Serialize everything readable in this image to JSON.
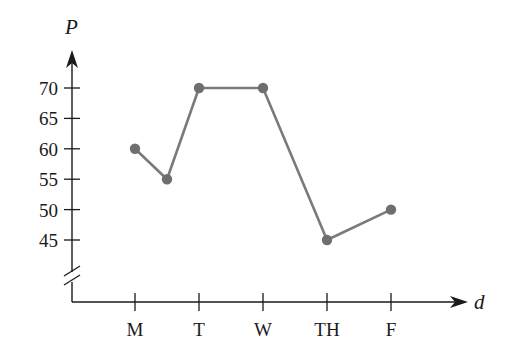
{
  "chart_data": {
    "type": "line",
    "title": "",
    "xlabel": "d",
    "ylabel": "P",
    "categories": [
      "M",
      "T",
      "W",
      "TH",
      "F"
    ],
    "x_positions": [
      1,
      2,
      3,
      4,
      5
    ],
    "points": [
      {
        "x": 1,
        "y": 60
      },
      {
        "x": 1.5,
        "y": 55
      },
      {
        "x": 2,
        "y": 70
      },
      {
        "x": 3,
        "y": 70
      },
      {
        "x": 4,
        "y": 45
      },
      {
        "x": 5,
        "y": 50
      }
    ],
    "series": [
      {
        "name": "P",
        "x": [
          1,
          1.5,
          2,
          3,
          4,
          5
        ],
        "values": [
          60,
          55,
          70,
          70,
          45,
          50
        ],
        "color": "#777777"
      }
    ],
    "yticks": [
      45,
      50,
      55,
      60,
      65,
      70
    ],
    "ylim": [
      40,
      72
    ],
    "y_axis_break": true,
    "grid": false,
    "legend": "none"
  },
  "colors": {
    "axis": "#1a1a1a",
    "line": "#7a7a7a",
    "marker": "#6e6e6e"
  }
}
